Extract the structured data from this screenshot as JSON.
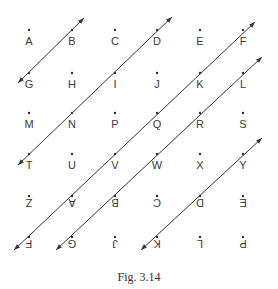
{
  "figure": {
    "caption": "Fig. 3.14",
    "grid": {
      "columns_x": [
        29,
        72,
        115,
        157,
        200,
        243
      ],
      "rows_y": [
        30,
        73,
        113,
        154,
        196,
        237
      ],
      "label_offset_y": 11,
      "rows": [
        [
          {
            "t": "A",
            "flip": false
          },
          {
            "t": "B",
            "flip": false
          },
          {
            "t": "C",
            "flip": false
          },
          {
            "t": "D",
            "flip": false
          },
          {
            "t": "E",
            "flip": false
          },
          {
            "t": "F",
            "flip": false
          }
        ],
        [
          {
            "t": "G",
            "flip": false
          },
          {
            "t": "H",
            "flip": false
          },
          {
            "t": "I",
            "flip": false
          },
          {
            "t": "J",
            "flip": false
          },
          {
            "t": "K",
            "flip": false
          },
          {
            "t": "L",
            "flip": false
          }
        ],
        [
          {
            "t": "M",
            "flip": false
          },
          {
            "t": "N",
            "flip": false
          },
          {
            "t": "P",
            "flip": false
          },
          {
            "t": "Q",
            "flip": false
          },
          {
            "t": "R",
            "flip": false
          },
          {
            "t": "S",
            "flip": false
          }
        ],
        [
          {
            "t": "T",
            "flip": false
          },
          {
            "t": "U",
            "flip": false
          },
          {
            "t": "V",
            "flip": false
          },
          {
            "t": "W",
            "flip": false
          },
          {
            "t": "X",
            "flip": false
          },
          {
            "t": "Y",
            "flip": false
          }
        ],
        [
          {
            "t": "Z",
            "flip": true
          },
          {
            "t": "A",
            "flip": true
          },
          {
            "t": "B",
            "flip": true
          },
          {
            "t": "C",
            "flip": true
          },
          {
            "t": "D",
            "flip": true
          },
          {
            "t": "E",
            "flip": true
          }
        ],
        [
          {
            "t": "F",
            "flip": true
          },
          {
            "t": "G",
            "flip": true
          },
          {
            "t": "J",
            "flip": true
          },
          {
            "t": "K",
            "flip": true
          },
          {
            "t": "L",
            "flip": true
          },
          {
            "t": "P",
            "flip": true
          }
        ]
      ]
    },
    "lines": [
      {
        "name": "line-G-B",
        "x1": 18,
        "y1": 83,
        "x2": 84,
        "y2": 18,
        "arrow_start": true,
        "arrow_end": true
      },
      {
        "name": "line-T-D",
        "x1": 18,
        "y1": 165,
        "x2": 172,
        "y2": 17,
        "arrow_start": true,
        "arrow_end": true
      },
      {
        "name": "line-F-F",
        "x1": 14,
        "y1": 250,
        "x2": 255,
        "y2": 22,
        "arrow_start": true,
        "arrow_end": true
      },
      {
        "name": "line-G-L",
        "x1": 56,
        "y1": 250,
        "x2": 262,
        "y2": 57,
        "arrow_start": true,
        "arrow_end": true
      },
      {
        "name": "line-K-Y",
        "x1": 141,
        "y1": 250,
        "x2": 262,
        "y2": 138,
        "arrow_start": true,
        "arrow_end": true
      }
    ],
    "colors": {
      "ink": "#333333",
      "background": "#ffffff"
    }
  }
}
